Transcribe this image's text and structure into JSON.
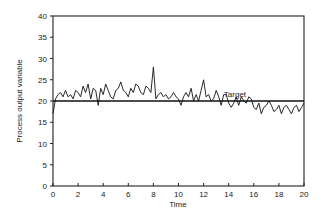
{
  "chart_data": {
    "type": "line",
    "title": "",
    "xlabel": "Time",
    "ylabel": "Process output variable",
    "xlim": [
      0,
      20
    ],
    "ylim": [
      0,
      40
    ],
    "xticks": [
      0,
      2,
      4,
      6,
      8,
      10,
      12,
      14,
      16,
      18,
      20
    ],
    "yticks": [
      0,
      5,
      10,
      15,
      20,
      25,
      30,
      35,
      40
    ],
    "grid": false,
    "legend": null,
    "annotations": [
      {
        "text": "Target",
        "x": 14.5,
        "y": 20.7
      }
    ],
    "reference_lines": [
      {
        "name": "Target",
        "y": 20
      }
    ],
    "series": [
      {
        "name": "Process output",
        "x": [
          0,
          0.2,
          0.4,
          0.6,
          0.8,
          1.0,
          1.2,
          1.4,
          1.6,
          1.8,
          2.0,
          2.2,
          2.4,
          2.6,
          2.8,
          3.0,
          3.2,
          3.4,
          3.6,
          3.8,
          4.0,
          4.2,
          4.4,
          4.6,
          4.8,
          5.0,
          5.2,
          5.4,
          5.6,
          5.8,
          6.0,
          6.2,
          6.4,
          6.6,
          6.8,
          7.0,
          7.2,
          7.4,
          7.6,
          7.8,
          8.0,
          8.2,
          8.4,
          8.6,
          8.8,
          9.0,
          9.2,
          9.4,
          9.6,
          9.8,
          10.0,
          10.2,
          10.4,
          10.6,
          10.8,
          11.0,
          11.2,
          11.4,
          11.6,
          11.8,
          12.0,
          12.2,
          12.4,
          12.6,
          12.8,
          13.0,
          13.2,
          13.4,
          13.6,
          13.8,
          14.0,
          14.2,
          14.4,
          14.6,
          14.8,
          15.0,
          15.2,
          15.4,
          15.6,
          15.8,
          16.0,
          16.2,
          16.4,
          16.6,
          16.8,
          17.0,
          17.2,
          17.4,
          17.6,
          17.8,
          18.0,
          18.2,
          18.4,
          18.6,
          18.8,
          19.0,
          19.2,
          19.4,
          19.6,
          19.8,
          20.0
        ],
        "values": [
          17,
          20.5,
          21.5,
          22,
          21,
          22.5,
          21,
          21.5,
          20.5,
          22.5,
          22,
          21,
          23.5,
          22,
          24,
          20.5,
          23,
          22.5,
          19,
          23,
          21.5,
          24,
          22.5,
          21,
          20.5,
          22.5,
          23,
          24.5,
          22.5,
          22,
          21,
          23,
          22,
          24,
          23.5,
          22,
          21.5,
          23.5,
          23,
          22,
          28,
          20.5,
          21.5,
          22,
          21,
          21.5,
          20.5,
          21,
          22,
          21,
          20.5,
          19,
          21,
          22,
          21,
          23,
          20,
          21.5,
          20,
          22.5,
          25,
          21,
          21.5,
          20,
          20.5,
          22.5,
          21,
          19,
          21.5,
          21.5,
          19.5,
          18.5,
          19.5,
          21,
          19,
          21,
          20,
          19.5,
          21,
          20.5,
          18.5,
          18,
          19.5,
          17,
          18.5,
          19,
          20,
          19,
          17.5,
          18,
          19,
          17,
          18.5,
          19,
          18,
          17,
          18.5,
          19,
          17.5,
          18.5,
          19.5
        ],
        "color": "#111111"
      }
    ]
  },
  "labels": {
    "xlabel": "Time",
    "ylabel": "Process output variable",
    "target": "Target",
    "xticks": [
      "0",
      "2",
      "4",
      "6",
      "8",
      "10",
      "12",
      "14",
      "16",
      "18",
      "20"
    ],
    "yticks": [
      "0",
      "5",
      "10",
      "15",
      "20",
      "25",
      "30",
      "35",
      "40"
    ]
  }
}
